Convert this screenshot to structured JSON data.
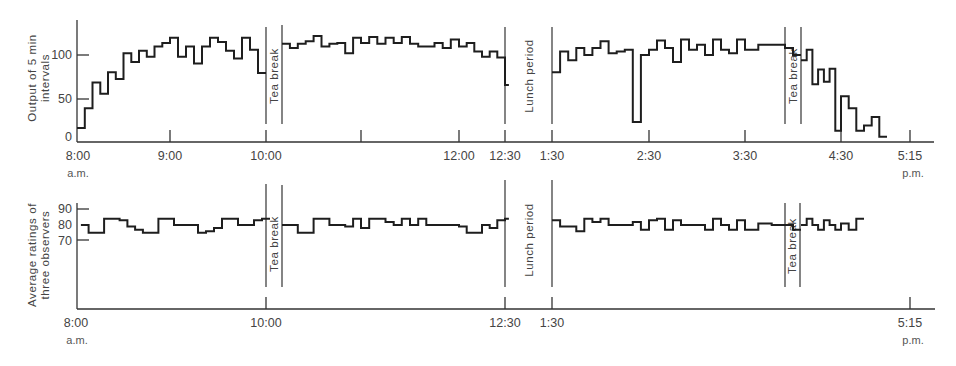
{
  "chart_data": [
    {
      "type": "line",
      "style": "step",
      "title": "",
      "ylabel": "Output of 5 min intervals",
      "xlabel": "",
      "yticks": [
        0,
        50,
        100
      ],
      "ylim": [
        0,
        130
      ],
      "xticks": [
        {
          "label": "8:00",
          "sub": "a.m.",
          "minutes": 0
        },
        {
          "label": "9:00",
          "minutes": 60
        },
        {
          "label": "10:00",
          "minutes": 120
        },
        {
          "label": "",
          "minutes": 180
        },
        {
          "label": "12:00",
          "minutes": 240
        },
        {
          "label": "12:30",
          "minutes": 270
        },
        {
          "label": "1:30",
          "minutes": 330
        },
        {
          "label": "2:30",
          "minutes": 390
        },
        {
          "label": "3:30",
          "minutes": 450
        },
        {
          "label": "4:30",
          "minutes": 510
        },
        {
          "label": "5:15",
          "sub": "p.m.",
          "minutes": 555
        }
      ],
      "breaks": [
        {
          "label": "Tea break",
          "start_min": 120,
          "end_min": 130
        },
        {
          "label": "Lunch period",
          "start_min": 270,
          "end_min": 330
        },
        {
          "label": "Tea break",
          "start_min": 465,
          "end_min": 475
        }
      ],
      "segments": [
        {
          "start_min": 0,
          "step_min": 5,
          "values": [
            15,
            38,
            68,
            55,
            80,
            72,
            102,
            92,
            105,
            98,
            110,
            114,
            120,
            98,
            110,
            90,
            110,
            120,
            115,
            105,
            96,
            120,
            106,
            79
          ]
        },
        {
          "start_min": 130,
          "step_min": 5,
          "values": [
            113,
            108,
            113,
            116,
            122,
            110,
            113,
            114,
            102,
            120,
            114,
            121,
            113,
            120,
            114,
            121,
            113,
            110,
            110,
            114,
            108,
            118,
            110,
            114,
            104,
            98,
            104,
            97,
            65
          ]
        },
        {
          "start_min": 330,
          "step_min": 5,
          "values": [
            80,
            104,
            94,
            108,
            100,
            108,
            116,
            102,
            104,
            106,
            22,
            100,
            106,
            117,
            108,
            92,
            118,
            106,
            112,
            100,
            118,
            106,
            102,
            118,
            106,
            112,
            112,
            108,
            100
          ]
        },
        {
          "start_min": 475,
          "step_min": 5,
          "values": [
            94,
            106,
            66,
            83,
            69,
            84,
            12,
            52,
            38,
            12,
            18,
            28,
            5
          ]
        }
      ]
    },
    {
      "type": "line",
      "style": "step",
      "title": "",
      "ylabel": "Average ratings of three observers",
      "xlabel": "",
      "yticks": [
        70,
        80,
        90
      ],
      "ylim": [
        70,
        90
      ],
      "xticks": [
        {
          "label": "8:00",
          "sub": "a.m.",
          "minutes": 0
        },
        {
          "label": "10:00",
          "minutes": 120
        },
        {
          "label": "12:30",
          "minutes": 270
        },
        {
          "label": "1:30",
          "minutes": 330
        },
        {
          "label": "5:15",
          "sub": "p.m.",
          "minutes": 555
        }
      ],
      "breaks": [
        {
          "label": "Tea break",
          "start_min": 120,
          "end_min": 130
        },
        {
          "label": "Lunch period",
          "start_min": 270,
          "end_min": 330
        },
        {
          "label": "Tea break",
          "start_min": 465,
          "end_min": 475
        }
      ],
      "segments": [
        {
          "start_min": 2.5,
          "step_min": 5,
          "values": [
            80,
            75,
            75,
            84,
            84,
            83,
            79,
            77,
            75,
            75,
            84,
            84,
            80,
            80,
            80,
            75,
            76,
            78,
            84,
            84,
            80,
            80,
            83,
            84
          ]
        },
        {
          "start_min": 130,
          "step_min": 5,
          "values": [
            80,
            80,
            75,
            75,
            84,
            84,
            80,
            80,
            79,
            84,
            78,
            84,
            84,
            82,
            80,
            84,
            80,
            84,
            80,
            80,
            80,
            80,
            79,
            75,
            75,
            80,
            78,
            83,
            84
          ]
        },
        {
          "start_min": 330,
          "step_min": 5,
          "values": [
            83,
            79,
            79,
            76,
            84,
            82,
            84,
            80,
            80,
            80,
            82,
            77,
            83,
            84,
            77,
            83,
            80,
            80,
            80,
            77,
            84,
            80,
            77,
            83,
            77,
            81,
            80,
            80,
            77
          ]
        },
        {
          "start_min": 475,
          "step_min": 5,
          "values": [
            80,
            84,
            80,
            77,
            83,
            80,
            77,
            81,
            77,
            84
          ]
        }
      ]
    }
  ],
  "labels": {
    "top_ylabel_line1": "Output of 5 min",
    "top_ylabel_line2": "intervals",
    "bottom_ylabel_line1": "Average ratings of",
    "bottom_ylabel_line2": "three observers",
    "tea_break": "Tea break",
    "lunch_period": "Lunch period",
    "am": "a.m.",
    "pm": "p.m.",
    "top_yticks": [
      "0",
      "50",
      "100"
    ],
    "bottom_yticks": [
      "70",
      "80",
      "90"
    ],
    "top_xticks": [
      "8:00",
      "9:00",
      "10:00",
      "12:00",
      "12:30",
      "1:30",
      "2:30",
      "3:30",
      "4:30",
      "5:15"
    ],
    "bottom_xticks": [
      "8:00",
      "10:00",
      "12:30",
      "1:30",
      "5:15"
    ]
  },
  "colors": {
    "line": "#1e1e1e",
    "axis": "#333333",
    "text": "#444444",
    "background": "#ffffff"
  }
}
